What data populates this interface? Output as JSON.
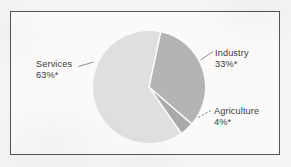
{
  "figure": {
    "background_color": "#f6f5f3",
    "frame_color": "#53555a",
    "frame_fill": "#fbfaf8"
  },
  "chart_data": {
    "type": "pie",
    "title": "",
    "subtitle": "",
    "xlabel": "",
    "ylabel": "",
    "grid": false,
    "legend_position": "none",
    "labels_position": "outside-with-leader-lines",
    "total": 100,
    "units": "percent",
    "footnote_marker": "*",
    "categories": [
      "Services",
      "Industry",
      "Agriculture"
    ],
    "values": [
      63,
      33,
      4
    ],
    "slices": [
      {
        "name": "Services",
        "label": "Services",
        "value": 63,
        "value_text": "63%*",
        "color": "#dfdfdd",
        "start_angle_deg": 20,
        "end_angle_deg": 246.8
      },
      {
        "name": "Industry",
        "label": "Industry",
        "value": 33,
        "value_text": "33%*",
        "color": "#b4b4b2",
        "start_angle_deg": 348.2,
        "end_angle_deg": 106.9
      },
      {
        "name": "Agriculture",
        "label": "Agriculture",
        "value": 4,
        "value_text": "4%*",
        "color": "#a9a9a7",
        "start_angle_deg": 108.4,
        "end_angle_deg": 122.8
      }
    ]
  },
  "labels": {
    "services": {
      "name": "Services",
      "percent": "63%*"
    },
    "industry": {
      "name": "Industry",
      "percent": "33%*"
    },
    "agriculture": {
      "name": "Agriculture",
      "percent": "4%*"
    }
  },
  "geometry": {
    "center_x": 149,
    "center_y": 87,
    "radius": 56
  }
}
